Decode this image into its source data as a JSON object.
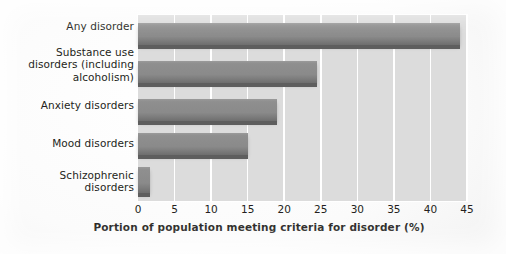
{
  "chart_data": {
    "type": "bar",
    "orientation": "horizontal",
    "title": "",
    "subtitle": "",
    "xlabel": "Portion of population meeting criteria for disorder (%)",
    "ylabel": "",
    "xlim": [
      0,
      45
    ],
    "xticks": [
      0,
      5,
      10,
      15,
      20,
      25,
      30,
      35,
      40,
      45
    ],
    "xtick_labels": [
      "0",
      "5",
      "10",
      "15",
      "20",
      "25",
      "30",
      "35",
      "40",
      "45"
    ],
    "grid": "vertical",
    "legend": "none",
    "categories": [
      "Any disorder",
      "Substance use disorders (including alcoholism)",
      "Anxiety disorders",
      "Mood disorders",
      "Schizophrenic disorders"
    ],
    "values": [
      44,
      24.5,
      19,
      15,
      1.7
    ],
    "bar_color": "#8a8a8a",
    "plot_background": "#dcdcdc",
    "gridline_color": "#ffffff",
    "text_color": "#241f20"
  },
  "categories": [
    {
      "label_lines": [
        "Any disorder"
      ],
      "value": 44
    },
    {
      "label_lines": [
        "Substance use",
        "disorders (including",
        "alcoholism)"
      ],
      "value": 24.5
    },
    {
      "label_lines": [
        "Anxiety disorders"
      ],
      "value": 19
    },
    {
      "label_lines": [
        "Mood disorders"
      ],
      "value": 15
    },
    {
      "label_lines": [
        "Schizophrenic",
        "disorders"
      ],
      "value": 1.7
    }
  ],
  "axis": {
    "x_title": "Portion of population meeting criteria for disorder (%)",
    "ticks": [
      "0",
      "5",
      "10",
      "15",
      "20",
      "25",
      "30",
      "35",
      "40",
      "45"
    ]
  }
}
